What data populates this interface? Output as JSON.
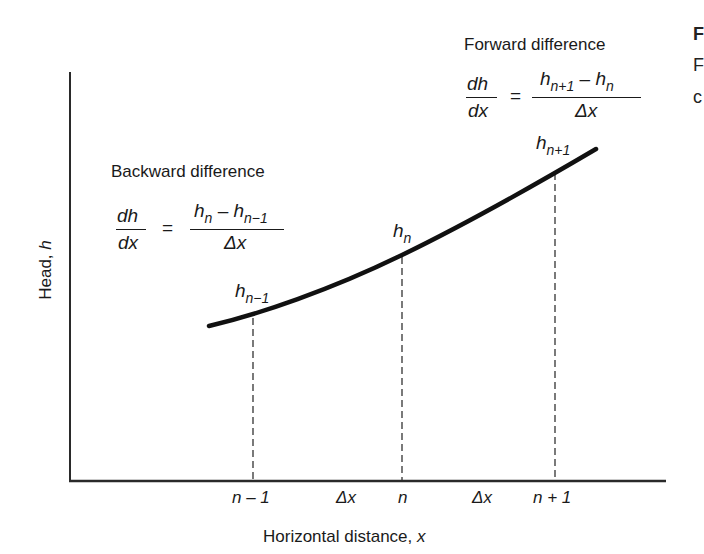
{
  "figure": {
    "type": "finite-difference schematic",
    "axes": {
      "y_label_text": "Head, ",
      "y_label_var": "h",
      "x_label_text": "Horizontal distance, ",
      "x_label_var": "x"
    },
    "ticks": [
      {
        "text": "n – 1",
        "x_px": 253
      },
      {
        "text": "Δx",
        "x_px": 328
      },
      {
        "text": "n",
        "x_px": 402
      },
      {
        "text": "Δx",
        "x_px": 478
      },
      {
        "text": "n + 1",
        "x_px": 555
      }
    ],
    "points": [
      {
        "label_base": "h",
        "label_sub": "n−1",
        "x_px": 253,
        "y_px": 316
      },
      {
        "label_base": "h",
        "label_sub": "n",
        "x_px": 402,
        "y_px": 255
      },
      {
        "label_base": "h",
        "label_sub": "n+1",
        "x_px": 555,
        "y_px": 171
      }
    ],
    "backward": {
      "title": "Backward difference",
      "lhs_num": "dh",
      "lhs_den": "dx",
      "equals": "=",
      "rhs_num_a_base": "h",
      "rhs_num_a_sub": "n",
      "rhs_minus": " – ",
      "rhs_num_b_base": "h",
      "rhs_num_b_sub": "n−1",
      "rhs_den": "Δx"
    },
    "forward": {
      "title": "Forward difference",
      "lhs_num": "dh",
      "lhs_den": "dx",
      "equals": "=",
      "rhs_num_a_base": "h",
      "rhs_num_a_sub": "n+1",
      "rhs_minus": " – ",
      "rhs_num_b_base": "h",
      "rhs_num_b_sub": "n",
      "rhs_den": "Δx"
    },
    "cropped_text": {
      "line1": "F",
      "line2": "F",
      "line3": "c"
    },
    "colors": {
      "ink": "#1a1a1a",
      "background": "#ffffff"
    }
  }
}
